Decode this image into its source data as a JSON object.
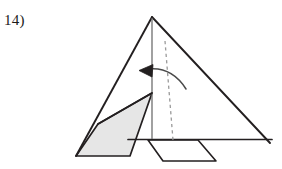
{
  "figure": {
    "label": "14)",
    "kind": "origami-fold-diagram",
    "colors": {
      "stroke": "#231f20",
      "shade_fill": "#e6e6e6",
      "dashed_stroke": "#9a9a9a",
      "background": "#ffffff",
      "text": "#1a1a1a"
    },
    "geometry": {
      "canvas": {
        "width": 282,
        "height": 169
      },
      "main_triangle": [
        [
          152,
          17
        ],
        [
          270,
          143
        ],
        [
          76,
          156
        ]
      ],
      "baseline": {
        "x1": 128,
        "y1": 139,
        "x2": 272,
        "y2": 139
      },
      "vertical_crease": {
        "x1": 152,
        "y1": 18,
        "x2": 152,
        "y2": 139
      },
      "left_edge": {
        "x1": 152,
        "y1": 17,
        "x2": 76,
        "y2": 156
      },
      "right_edge": {
        "x1": 152,
        "y1": 17,
        "x2": 270,
        "y2": 143
      },
      "shaded_flap": [
        [
          152,
          93
        ],
        [
          130,
          156
        ],
        [
          76,
          156
        ],
        [
          98,
          124
        ]
      ],
      "flap_inner_edge": {
        "x1": 98,
        "y1": 124,
        "x2": 152,
        "y2": 93
      },
      "dashed_fold_line": {
        "x1": 165,
        "y1": 41,
        "x2": 173,
        "y2": 140
      },
      "bottom_flap": [
        [
          148,
          140
        ],
        [
          163,
          161
        ],
        [
          216,
          161
        ],
        [
          198,
          140
        ]
      ],
      "arrow_curve": {
        "start_x": 186,
        "start_y": 89,
        "ctrl_x": 168,
        "ctrl_y": 66,
        "end_x": 142,
        "end_y": 70
      },
      "arrow_head": [
        [
          140,
          70
        ],
        [
          152,
          65
        ],
        [
          151,
          76
        ]
      ]
    }
  }
}
